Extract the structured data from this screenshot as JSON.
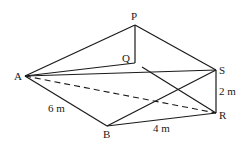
{
  "diagram": {
    "type": "3D wedge / triangular prism figure",
    "points": {
      "P": {
        "label": "P",
        "x": 135,
        "y": 25
      },
      "Q": {
        "label": "Q",
        "x": 135,
        "y": 63
      },
      "A": {
        "label": "A",
        "x": 25,
        "y": 76
      },
      "S": {
        "label": "S",
        "x": 216,
        "y": 70
      },
      "R": {
        "label": "R",
        "x": 216,
        "y": 113
      },
      "B": {
        "label": "B",
        "x": 107,
        "y": 126
      }
    },
    "measurements": {
      "AB": "6 m",
      "BR": "4 m",
      "SR": "2 m"
    },
    "solid_edges": [
      "AP",
      "PS",
      "PQ",
      "AQ",
      "AS",
      "AB",
      "BR",
      "SR",
      "BS",
      "QR"
    ],
    "dashed_edges": [
      "AR"
    ]
  }
}
